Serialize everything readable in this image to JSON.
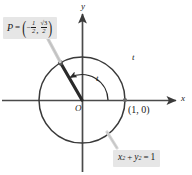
{
  "figure": {
    "background": "#ffffff",
    "stroke_color": "#3a3a3a",
    "label_background": "#e6e6e6",
    "text_color": "#1a1a1a"
  },
  "point_label": {
    "name": "P",
    "equals": "=",
    "open_paren": "(",
    "close_paren": ")",
    "x_sign": "−",
    "x_numerator": "1",
    "x_denominator": "2",
    "comma": ",",
    "y_numerator": "√3",
    "y_denominator": "2",
    "plain_text": "P = (-1/2, √3/2)"
  },
  "equation_label": {
    "x_var": "x",
    "x_exp": "2",
    "plus": "+",
    "y_var": "y",
    "y_exp": "2",
    "equals": "=",
    "value": "1",
    "plain_text": "x² + y² = 1"
  },
  "axes": {
    "x_label": "x",
    "y_label": "y",
    "origin_label": "O"
  },
  "arcs": {
    "inner_angle_label": "t",
    "outer_arc_label": "t"
  },
  "intercept": {
    "label": "(1, 0)"
  },
  "geometry": {
    "center_x": 82,
    "center_y": 100,
    "radius": 43,
    "point_angle_degrees": 120,
    "point_x": -0.5,
    "point_y": 0.866
  }
}
